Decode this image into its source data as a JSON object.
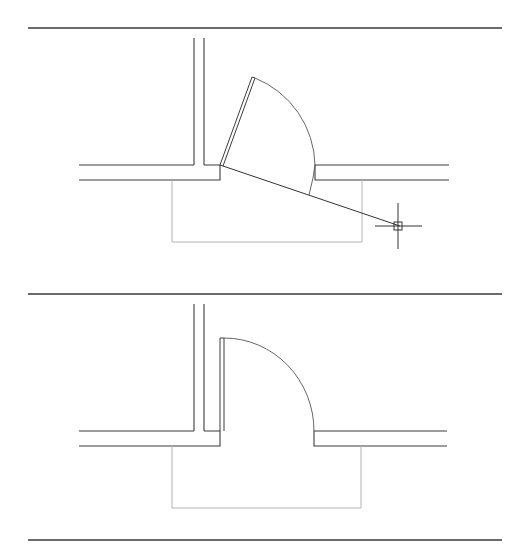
{
  "figure": {
    "panels": [
      {
        "id": "before",
        "description": "Door leaf being rotated with rubber-band line to crosshair cursor",
        "door_state": "rotating",
        "cursor": {
          "x": 402,
          "y": 226,
          "type": "crosshair-pickbox"
        }
      },
      {
        "id": "after",
        "description": "Door leaf rotated to perpendicular open position",
        "door_state": "open-90"
      }
    ],
    "colors": {
      "background": "#ffffff",
      "wall": "#3c3c3c",
      "floor_outline": "#b4b4b4",
      "separator": "#3a3a3a"
    }
  }
}
